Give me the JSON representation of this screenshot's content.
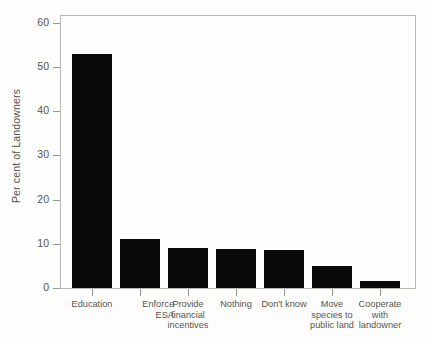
{
  "chart_data": {
    "type": "bar",
    "title": "",
    "xlabel": "",
    "ylabel": "Per cent of Landowners",
    "ylim": [
      0,
      62
    ],
    "yticks": [
      0,
      10,
      20,
      30,
      40,
      50,
      60
    ],
    "ytick_labels": [
      "0",
      "10",
      "20",
      "30",
      "40",
      "50",
      "60"
    ],
    "grid": false,
    "legend": false,
    "bar_color": "#0a0a0a",
    "frame_color": "#b9b9b4",
    "text_color": "#55554f",
    "background": "#fdfdfb",
    "categories": [
      "Education",
      "Enforce\nESA",
      "Provide\nfinancial\nincentives",
      "Nothing",
      "Don't know",
      "Move\nspecies to\npublic land",
      "Cooperate\nwith\nlandowner"
    ],
    "values": [
      53,
      11,
      9,
      8.8,
      8.7,
      5,
      1.7
    ]
  },
  "axis": {
    "y_title": "Per cent of Landowners"
  }
}
